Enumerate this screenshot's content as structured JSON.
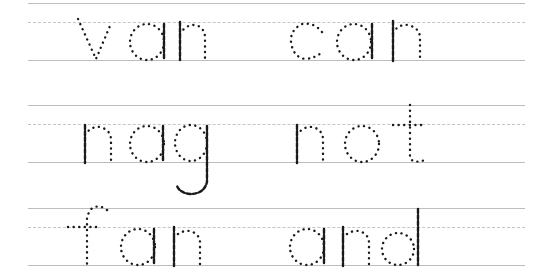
{
  "worksheet": {
    "type": "handwriting tracing practice",
    "rows": [
      {
        "words": [
          "van",
          "can"
        ]
      },
      {
        "words": [
          "nag",
          "not"
        ]
      },
      {
        "words": [
          "fan",
          "and"
        ]
      }
    ]
  },
  "colors": {
    "guide_line": "#bdbdbd",
    "dot": "#1a1a1a",
    "background": "#ffffff"
  }
}
